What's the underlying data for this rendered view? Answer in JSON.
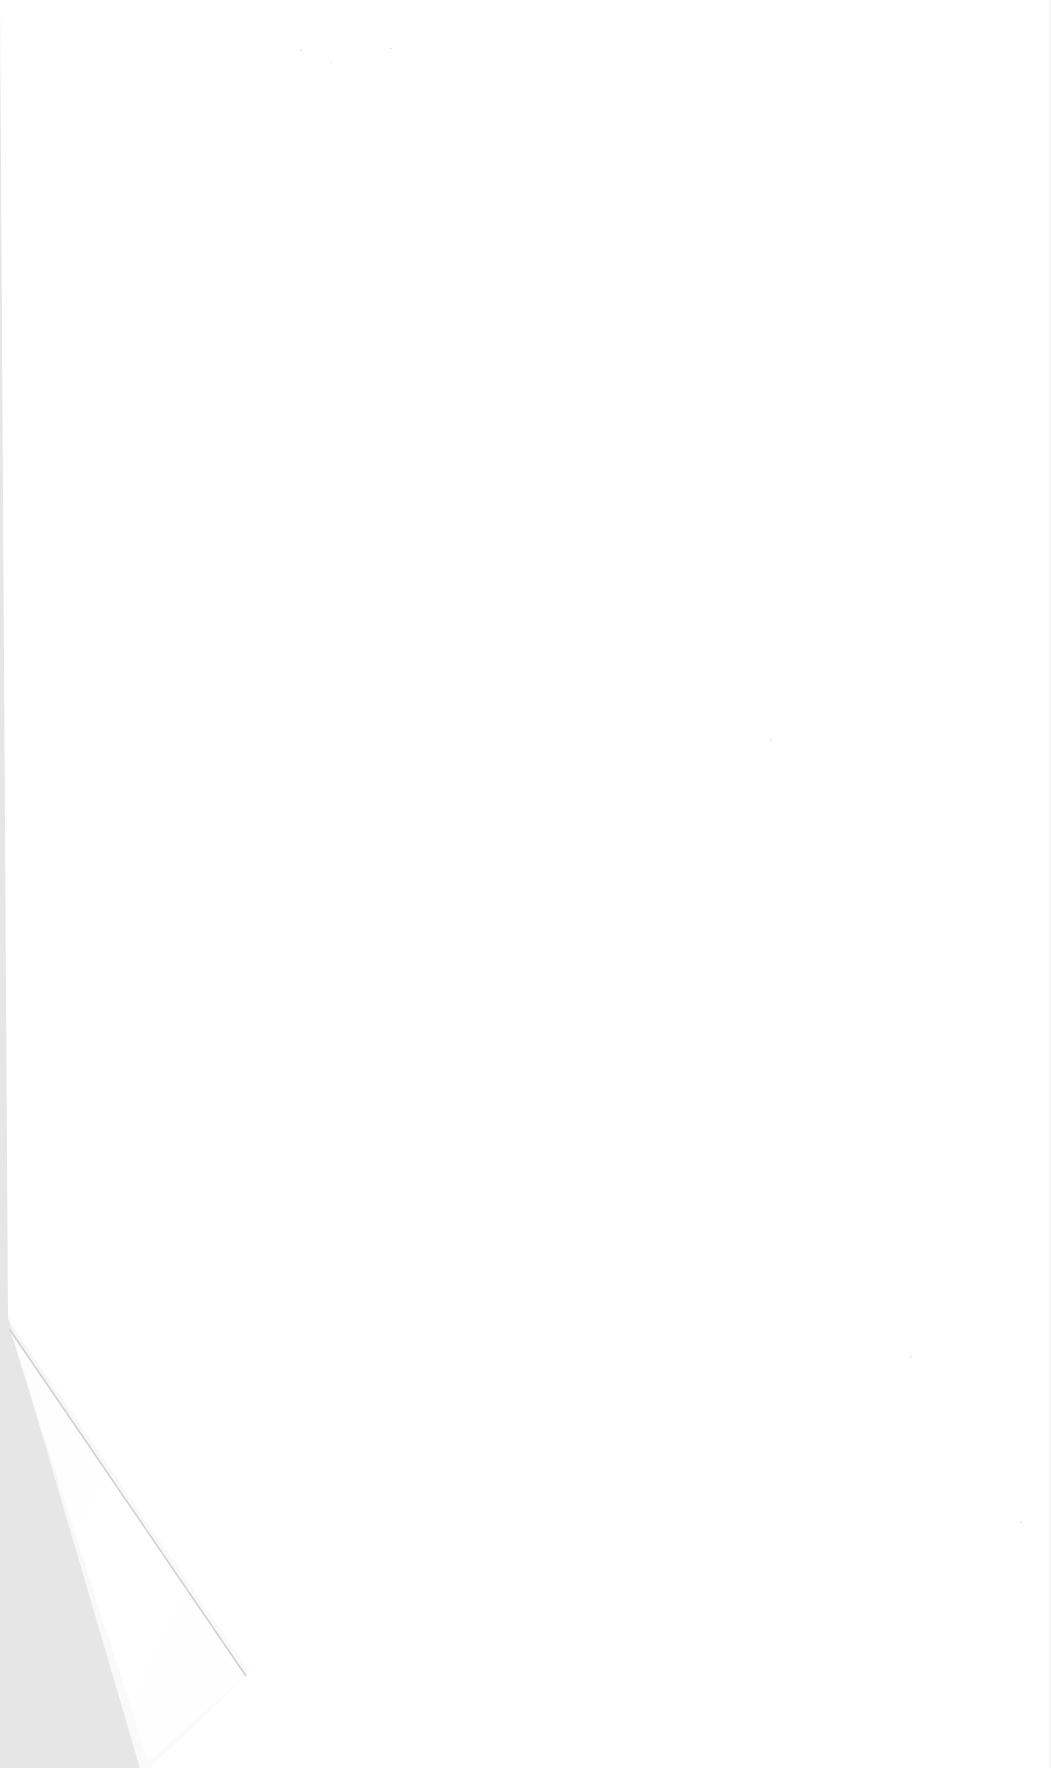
{
  "page": {
    "type": "blank-paper-sheet",
    "content_text": "",
    "background_color": "#e6e6e6",
    "sheet_color": "#ffffff",
    "features": {
      "curled_corner": "bottom-left",
      "visible_text": "none"
    }
  }
}
